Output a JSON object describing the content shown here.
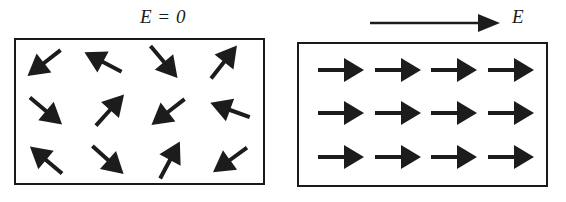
{
  "figure": {
    "background_color": "#ffffff",
    "ink_color": "#1c1c1c",
    "border_color": "#1a1a1a"
  },
  "panels": [
    {
      "id": "no-field",
      "label": "E = 0",
      "label_x": 140,
      "label_y": 6,
      "box": {
        "x": 14,
        "y": 38,
        "width": 251,
        "height": 147
      },
      "arrow_style": {
        "length": 42,
        "head_length": 21,
        "head_half_width": 12,
        "shaft_width": 4
      },
      "dipoles": [
        {
          "cx": 44,
          "cy": 63,
          "angle_deg": 218
        },
        {
          "cx": 103,
          "cy": 62,
          "angle_deg": 152
        },
        {
          "cx": 164,
          "cy": 62,
          "angle_deg": 310
        },
        {
          "cx": 224,
          "cy": 62,
          "angle_deg": 52
        },
        {
          "cx": 46,
          "cy": 111,
          "angle_deg": 320
        },
        {
          "cx": 110,
          "cy": 110,
          "angle_deg": 48
        },
        {
          "cx": 168,
          "cy": 112,
          "angle_deg": 218
        },
        {
          "cx": 230,
          "cy": 110,
          "angle_deg": 160
        },
        {
          "cx": 46,
          "cy": 160,
          "angle_deg": 140
        },
        {
          "cx": 108,
          "cy": 160,
          "angle_deg": 318
        },
        {
          "cx": 170,
          "cy": 160,
          "angle_deg": 62
        },
        {
          "cx": 230,
          "cy": 160,
          "angle_deg": 216
        }
      ]
    },
    {
      "id": "with-field",
      "label": "E",
      "label_x": 512,
      "label_y": 6,
      "box": {
        "x": 297,
        "y": 42,
        "width": 251,
        "height": 145
      },
      "arrow_style": {
        "length": 46,
        "head_length": 20,
        "head_half_width": 12,
        "shaft_width": 4
      },
      "dipoles": [
        {
          "cx": 341,
          "cy": 70,
          "angle_deg": 0
        },
        {
          "cx": 398,
          "cy": 70,
          "angle_deg": 0
        },
        {
          "cx": 454,
          "cy": 70,
          "angle_deg": 0
        },
        {
          "cx": 511,
          "cy": 70,
          "angle_deg": 0
        },
        {
          "cx": 341,
          "cy": 113,
          "angle_deg": 0
        },
        {
          "cx": 398,
          "cy": 113,
          "angle_deg": 0
        },
        {
          "cx": 454,
          "cy": 113,
          "angle_deg": 0
        },
        {
          "cx": 511,
          "cy": 113,
          "angle_deg": 0
        },
        {
          "cx": 341,
          "cy": 157,
          "angle_deg": 0
        },
        {
          "cx": 398,
          "cy": 157,
          "angle_deg": 0
        },
        {
          "cx": 454,
          "cy": 157,
          "angle_deg": 0
        },
        {
          "cx": 511,
          "cy": 157,
          "angle_deg": 0
        }
      ]
    }
  ],
  "field_vector": {
    "label": "E",
    "x1": 370,
    "y1": 23,
    "x2": 500,
    "y2": 23,
    "head_length": 22,
    "head_half_width": 9,
    "shaft_width": 2.5
  }
}
